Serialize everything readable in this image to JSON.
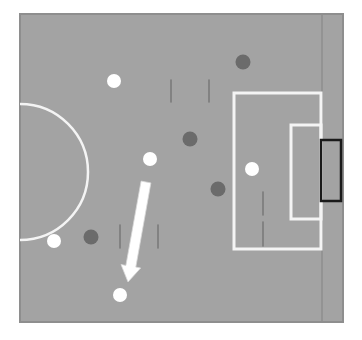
{
  "diagram": {
    "colors": {
      "background": "#ffffff",
      "pitch": "#a3a3a3",
      "pitch_edge": "#8e8e8e",
      "line": "#f4f4f4",
      "team_white": "#ffffff",
      "team_dark": "#6b6b6b",
      "goal_outline": "#1a1a1a",
      "pole": "#7a7a7a",
      "arrow": "#ffffff"
    },
    "pitch": {
      "x": 20,
      "y": 14,
      "width": 323,
      "height": 308
    },
    "goal_line_x": 322,
    "center_circle": {
      "cx": 20,
      "cy": 172,
      "r": 68
    },
    "penalty_box": {
      "x": 234,
      "y": 93,
      "width": 87,
      "height": 156
    },
    "goal_area": {
      "x": 291,
      "y": 125,
      "width": 30,
      "height": 94
    },
    "goal": {
      "x": 321,
      "y": 140,
      "width": 20,
      "height": 61
    },
    "players_white": [
      {
        "id": "w1",
        "x": 114,
        "y": 81
      },
      {
        "id": "w2",
        "x": 150,
        "y": 159
      },
      {
        "id": "w3",
        "x": 54,
        "y": 241
      },
      {
        "id": "w4",
        "x": 120,
        "y": 295
      },
      {
        "id": "w5",
        "x": 252,
        "y": 169
      }
    ],
    "players_dark": [
      {
        "id": "d1",
        "x": 243,
        "y": 62
      },
      {
        "id": "d2",
        "x": 190,
        "y": 139
      },
      {
        "id": "d3",
        "x": 218,
        "y": 189
      },
      {
        "id": "d4",
        "x": 91,
        "y": 237
      }
    ],
    "poles": [
      {
        "x": 171,
        "y1": 80,
        "y2": 102
      },
      {
        "x": 209,
        "y1": 80,
        "y2": 102
      },
      {
        "x": 120,
        "y1": 225,
        "y2": 248
      },
      {
        "x": 158,
        "y1": 225,
        "y2": 248
      },
      {
        "x": 263,
        "y1": 192,
        "y2": 215
      },
      {
        "x": 263,
        "y1": 222,
        "y2": 246
      }
    ],
    "arrow": {
      "x1": 146,
      "y1": 182,
      "x2": 128,
      "y2": 282
    }
  }
}
